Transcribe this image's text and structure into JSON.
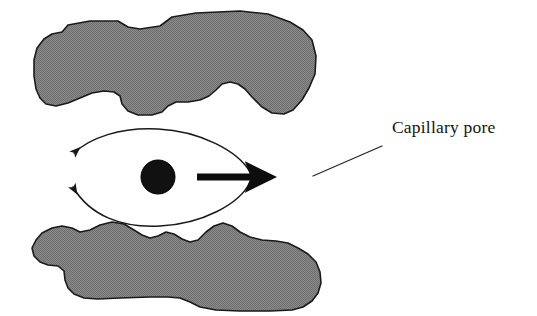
{
  "figure": {
    "background_color": "#ffffff",
    "canvas": {
      "width": 537,
      "height": 316
    }
  },
  "callout": {
    "label": "Capillary pore",
    "text_color": "#141414",
    "text_x": 392,
    "text_y": 133,
    "leader_line": {
      "from_x": 313,
      "from_y": 176,
      "to_x": 382,
      "to_y": 146,
      "color": "#262626"
    }
  },
  "solids": [
    {
      "name": "upper-solid-mass",
      "fill_color": "#808080",
      "outline_color": "#1a1a1a"
    },
    {
      "name": "lower-solid-mass",
      "fill_color": "#808080",
      "outline_color": "#1a1a1a"
    }
  ],
  "particle": {
    "name": "pore-particle",
    "fill_color": "#111111",
    "center_x": 158,
    "center_y": 177,
    "radius": 17
  },
  "arrows": {
    "straight": {
      "name": "transport-arrow",
      "direction": "right",
      "color": "#0d0d0d",
      "start_x": 197,
      "start_y": 177,
      "end_x": 281,
      "end_y": 177
    },
    "curved": [
      {
        "name": "upper-circulation-arc",
        "direction": "left",
        "color": "#191919"
      },
      {
        "name": "lower-circulation-arc",
        "direction": "left",
        "color": "#191919"
      }
    ]
  },
  "colors": {
    "solid_gray": "#808080",
    "ink_black": "#141414",
    "paper_white": "#ffffff"
  }
}
